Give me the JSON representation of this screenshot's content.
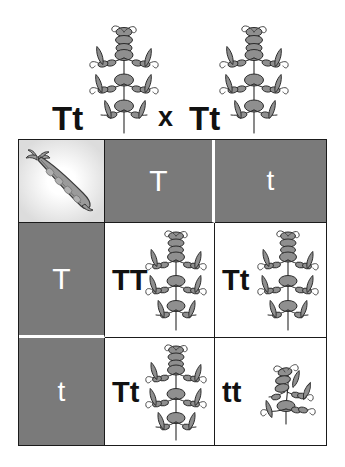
{
  "diagram": {
    "type": "punnett-square",
    "cross_label": {
      "parent1_genotype": "Tt",
      "cross_symbol": "x",
      "parent2_genotype": "Tt"
    },
    "trait": "plant height (tall vs dwarf pea plant)",
    "corner_icon": "pea-pod-icon",
    "column_headers": [
      "T",
      "t"
    ],
    "row_headers": [
      "T",
      "t"
    ],
    "offspring": [
      {
        "genotype": "TT",
        "phenotype_icon": "tall-pea-plant"
      },
      {
        "genotype": "Tt",
        "phenotype_icon": "tall-pea-plant"
      },
      {
        "genotype": "Tt",
        "phenotype_icon": "tall-pea-plant"
      },
      {
        "genotype": "tt",
        "phenotype_icon": "dwarf-pea-plant"
      }
    ],
    "colors": {
      "header_cell": "#7a7a7a",
      "header_text": "#ffffff",
      "genotype_text": "#111111",
      "grid_border": "#1b1b1b",
      "divider": "#ffffff",
      "plant_fill": "#8a8a8a",
      "plant_stroke": "#2b2b2b",
      "pod_fill": "#9a9a9a"
    }
  }
}
